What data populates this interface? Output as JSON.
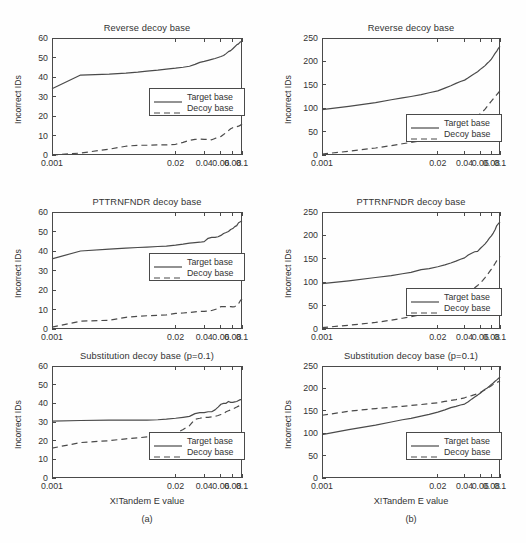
{
  "figure": {
    "background": "#fefefe",
    "line_color": "#4a4a4a",
    "text_color": "#333333"
  },
  "columns": [
    {
      "caption": "(a)",
      "xlabel": "X!Tandem E value"
    },
    {
      "caption": "(b)",
      "xlabel": "X!Tandem E value"
    }
  ],
  "legend": {
    "target_label": "Target base",
    "decoy_label": "Decoy base"
  },
  "axis": {
    "ylabel": "Incorrect IDs",
    "xticklabels": [
      "0.001",
      "0.02",
      "0.04",
      "0.06",
      "0.08",
      "0.1"
    ],
    "yticklabels_left": [
      "0",
      "10",
      "20",
      "30",
      "40",
      "50",
      "60"
    ],
    "yticklabels_right": [
      "0",
      "50",
      "100",
      "150",
      "200",
      "250"
    ]
  },
  "chart_data": [
    {
      "id": "a1",
      "type": "line",
      "title": "Reverse decoy base",
      "xlabel": "X!Tandem E value",
      "ylabel": "Incorrect IDs",
      "xlim": [
        0.001,
        0.1
      ],
      "ylim": [
        0,
        60
      ],
      "xticks": [
        0.001,
        0.02,
        0.04,
        0.06,
        0.08,
        0.1
      ],
      "yticks": [
        0,
        10,
        20,
        30,
        40,
        50,
        60
      ],
      "grid": false,
      "legend_position": "center-right",
      "x": [
        0.001,
        0.002,
        0.004,
        0.006,
        0.008,
        0.01,
        0.013,
        0.016,
        0.02,
        0.024,
        0.028,
        0.032,
        0.036,
        0.04,
        0.044,
        0.048,
        0.052,
        0.056,
        0.06,
        0.064,
        0.068,
        0.072,
        0.076,
        0.08,
        0.084,
        0.088,
        0.092,
        0.096,
        0.1
      ],
      "series": [
        {
          "name": "Target base",
          "style": "solid",
          "values": [
            34,
            41,
            41.5,
            42,
            42.5,
            43,
            43.5,
            44,
            44.5,
            45,
            45.5,
            46.5,
            47.5,
            48,
            48.5,
            49,
            49.5,
            50,
            50.5,
            51,
            52,
            53,
            53.5,
            54.5,
            55.5,
            56.5,
            57,
            58,
            58
          ]
        },
        {
          "name": "Decoy base",
          "style": "dashed",
          "values": [
            0,
            1,
            3,
            4.5,
            5,
            5,
            5.2,
            5.2,
            5.5,
            6.5,
            7.5,
            8,
            8.2,
            8,
            8,
            7.8,
            8.5,
            9,
            9.5,
            10.5,
            11.5,
            12.5,
            13.5,
            14,
            14,
            14.5,
            14.8,
            15.2,
            16
          ]
        }
      ]
    },
    {
      "id": "b1",
      "type": "line",
      "title": "Reverse decoy base",
      "xlabel": "X!Tandem E value",
      "ylabel": "Incorrect IDs",
      "xlim": [
        0.001,
        0.1
      ],
      "ylim": [
        0,
        250
      ],
      "xticks": [
        0.001,
        0.02,
        0.04,
        0.06,
        0.08,
        0.1
      ],
      "yticks": [
        0,
        50,
        100,
        150,
        200,
        250
      ],
      "grid": false,
      "legend_position": "lower-right",
      "x": [
        0.001,
        0.002,
        0.004,
        0.006,
        0.008,
        0.01,
        0.013,
        0.016,
        0.02,
        0.024,
        0.028,
        0.032,
        0.036,
        0.04,
        0.044,
        0.048,
        0.052,
        0.056,
        0.06,
        0.064,
        0.068,
        0.072,
        0.076,
        0.08,
        0.084,
        0.088,
        0.092,
        0.096,
        0.1
      ],
      "series": [
        {
          "name": "Target base",
          "style": "solid",
          "values": [
            97,
            104,
            112,
            118,
            122,
            125,
            129,
            133,
            137,
            143,
            148,
            153,
            157,
            160,
            165,
            170,
            174,
            178,
            183,
            187,
            191,
            196,
            200,
            205,
            211,
            217,
            222,
            228,
            232
          ]
        },
        {
          "name": "Decoy base",
          "style": "dashed",
          "values": [
            2,
            8,
            15,
            20,
            24,
            27,
            30,
            33,
            38,
            44,
            50,
            55,
            60,
            66,
            71,
            76,
            80,
            83,
            88,
            93,
            98,
            104,
            110,
            115,
            120,
            125,
            129,
            133,
            138
          ]
        }
      ]
    },
    {
      "id": "a2",
      "type": "line",
      "title": "PTTRNFNDR decoy base",
      "xlabel": "X!Tandem E value",
      "ylabel": "Incorrect IDs",
      "xlim": [
        0.001,
        0.1
      ],
      "ylim": [
        0,
        60
      ],
      "xticks": [
        0.001,
        0.02,
        0.04,
        0.06,
        0.08,
        0.1
      ],
      "yticks": [
        0,
        10,
        20,
        30,
        40,
        50,
        60
      ],
      "grid": false,
      "legend_position": "center-right",
      "x": [
        0.001,
        0.002,
        0.004,
        0.006,
        0.008,
        0.01,
        0.013,
        0.016,
        0.02,
        0.024,
        0.028,
        0.032,
        0.036,
        0.04,
        0.044,
        0.048,
        0.052,
        0.056,
        0.06,
        0.064,
        0.068,
        0.072,
        0.076,
        0.08,
        0.084,
        0.088,
        0.092,
        0.096,
        0.1
      ],
      "series": [
        {
          "name": "Target base",
          "style": "solid",
          "values": [
            36,
            40,
            41,
            41.5,
            41.8,
            42,
            42.3,
            42.5,
            43,
            43.5,
            44,
            44.3,
            44.5,
            44.8,
            46.5,
            47,
            47,
            47.3,
            48,
            49,
            49.5,
            50,
            51,
            51.5,
            52.5,
            53,
            54.5,
            55,
            55.5
          ]
        },
        {
          "name": "Decoy base",
          "style": "dashed",
          "values": [
            1,
            4,
            4.5,
            6,
            6.5,
            6.8,
            7,
            7.2,
            8,
            8.2,
            8.5,
            8.8,
            9,
            9,
            9.2,
            9.5,
            10,
            10.5,
            11.5,
            11.5,
            11.5,
            11.5,
            11.5,
            11.3,
            11.5,
            12,
            13,
            14.5,
            15.5
          ]
        }
      ]
    },
    {
      "id": "b2",
      "type": "line",
      "title": "PTTRNFNDR decoy base",
      "xlabel": "X!Tandem E value",
      "ylabel": "Incorrect IDs",
      "xlim": [
        0.001,
        0.1
      ],
      "ylim": [
        0,
        250
      ],
      "xticks": [
        0.001,
        0.02,
        0.04,
        0.06,
        0.08,
        0.1
      ],
      "yticks": [
        0,
        50,
        100,
        150,
        200,
        250
      ],
      "grid": false,
      "legend_position": "lower-right",
      "x": [
        0.001,
        0.002,
        0.004,
        0.006,
        0.008,
        0.01,
        0.013,
        0.016,
        0.02,
        0.024,
        0.028,
        0.032,
        0.036,
        0.04,
        0.044,
        0.048,
        0.052,
        0.056,
        0.06,
        0.064,
        0.068,
        0.072,
        0.076,
        0.08,
        0.084,
        0.088,
        0.092,
        0.096,
        0.1
      ],
      "series": [
        {
          "name": "Target base",
          "style": "solid",
          "values": [
            97,
            103,
            110,
            114,
            118,
            121,
            127,
            129,
            133,
            137,
            141,
            145,
            149,
            152,
            158,
            162,
            165,
            166,
            172,
            177,
            182,
            188,
            194,
            199,
            205,
            212,
            221,
            225,
            229
          ]
        },
        {
          "name": "Decoy base",
          "style": "dashed",
          "values": [
            3,
            8,
            14,
            19,
            23,
            26,
            31,
            36,
            42,
            48,
            54,
            59,
            64,
            70,
            76,
            82,
            88,
            93,
            98,
            104,
            110,
            116,
            122,
            128,
            134,
            140,
            146,
            151,
            155
          ]
        }
      ]
    },
    {
      "id": "a3",
      "type": "line",
      "title": "Substitution decoy base (p=0.1)",
      "xlabel": "X!Tandem E value",
      "ylabel": "Incorrect IDs",
      "xlim": [
        0.001,
        0.1
      ],
      "ylim": [
        0,
        60
      ],
      "xticks": [
        0.001,
        0.02,
        0.04,
        0.06,
        0.08,
        0.1
      ],
      "yticks": [
        0,
        10,
        20,
        30,
        40,
        50,
        60
      ],
      "grid": false,
      "legend_position": "lower-right",
      "x": [
        0.001,
        0.002,
        0.004,
        0.006,
        0.008,
        0.01,
        0.013,
        0.016,
        0.02,
        0.024,
        0.028,
        0.032,
        0.036,
        0.04,
        0.044,
        0.048,
        0.052,
        0.056,
        0.06,
        0.064,
        0.068,
        0.072,
        0.076,
        0.08,
        0.084,
        0.088,
        0.092,
        0.096,
        0.1
      ],
      "series": [
        {
          "name": "Target base",
          "style": "solid",
          "values": [
            30.5,
            30.8,
            31,
            31,
            31,
            31,
            31.2,
            31.5,
            32,
            32.5,
            33,
            34.5,
            35,
            35,
            35.5,
            35.5,
            36.5,
            38,
            39.5,
            40,
            40,
            41,
            40.5,
            40.5,
            40.8,
            41,
            41.5,
            42,
            42
          ]
        },
        {
          "name": "Decoy base",
          "style": "dashed",
          "values": [
            16,
            19,
            20,
            21,
            21.5,
            22,
            22,
            22.5,
            24,
            26,
            28,
            31.5,
            32,
            32.5,
            32.5,
            32.8,
            33,
            33.5,
            34,
            34.5,
            35.5,
            36,
            36.5,
            37,
            37.5,
            38,
            38.5,
            39,
            39.5
          ]
        }
      ]
    },
    {
      "id": "b3",
      "type": "line",
      "title": "Substitution decoy base (p=0.1)",
      "xlabel": "X!Tandem E value",
      "ylabel": "Incorrect IDs",
      "xlim": [
        0.001,
        0.1
      ],
      "ylim": [
        0,
        250
      ],
      "xticks": [
        0.001,
        0.02,
        0.04,
        0.06,
        0.08,
        0.1
      ],
      "yticks": [
        0,
        50,
        100,
        150,
        200,
        250
      ],
      "grid": false,
      "legend_position": "lower-right",
      "x": [
        0.001,
        0.002,
        0.004,
        0.006,
        0.008,
        0.01,
        0.013,
        0.016,
        0.02,
        0.024,
        0.028,
        0.032,
        0.036,
        0.04,
        0.044,
        0.048,
        0.052,
        0.056,
        0.06,
        0.064,
        0.068,
        0.072,
        0.076,
        0.08,
        0.084,
        0.088,
        0.092,
        0.096,
        0.1
      ],
      "series": [
        {
          "name": "Target base",
          "style": "solid",
          "values": [
            97,
            108,
            118,
            125,
            130,
            133,
            138,
            142,
            147,
            152,
            157,
            160,
            163,
            165,
            170,
            176,
            181,
            185,
            189,
            194,
            198,
            201,
            205,
            209,
            212,
            216,
            219,
            222,
            226
          ]
        },
        {
          "name": "Decoy base",
          "style": "dashed",
          "values": [
            140,
            149,
            155,
            158,
            160,
            162,
            164,
            166,
            168,
            171,
            173,
            175,
            177,
            179,
            182,
            184,
            186,
            188,
            191,
            194,
            197,
            200,
            203,
            206,
            209,
            211,
            213,
            215,
            217
          ]
        }
      ]
    }
  ]
}
